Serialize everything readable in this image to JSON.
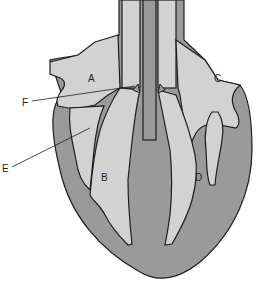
{
  "diagram": {
    "colors": {
      "background": "#ffffff",
      "muscle": "#9a9a9a",
      "chamber": "#d2d2d2",
      "outline": "#1e1e1e"
    },
    "labels": {
      "A": "A",
      "B": "B",
      "C": "C",
      "D": "D",
      "E": "E",
      "F": "F"
    }
  }
}
